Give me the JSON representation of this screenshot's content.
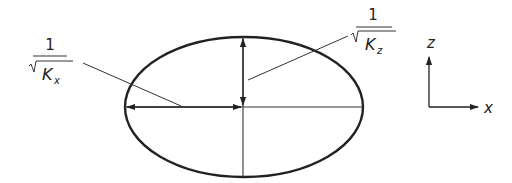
{
  "figure": {
    "labels": {
      "kx": {
        "numerator": "1",
        "symbol": "K",
        "subscript": "x"
      },
      "kz": {
        "numerator": "1",
        "symbol": "K",
        "subscript": "z"
      }
    },
    "axes": {
      "vertical": "z",
      "horizontal": "x"
    },
    "colors": {
      "stroke": "#222222",
      "background": "#ffffff"
    }
  }
}
